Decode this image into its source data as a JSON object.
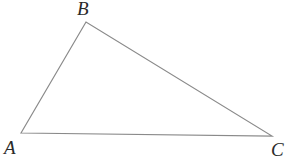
{
  "figure": {
    "kind": "geometry-diagram",
    "shape": "triangle",
    "width": 302,
    "height": 161,
    "background_color": "#ffffff",
    "stroke_color": "#8a8a8a",
    "stroke_width": 1.2,
    "label_color": "#2b2b2b"
  },
  "labels": {
    "a": "A",
    "b": "B",
    "c": "C"
  },
  "vertices": {
    "a": {
      "x": 21,
      "y": 133
    },
    "b": {
      "x": 86,
      "y": 22
    },
    "c": {
      "x": 272,
      "y": 136
    }
  },
  "geometry": {
    "points": "21,133 86,22 272,136",
    "edges": [
      {
        "name": "AB",
        "from": "A",
        "to": "B"
      },
      {
        "name": "BC",
        "from": "B",
        "to": "C"
      },
      {
        "name": "CA",
        "from": "C",
        "to": "A"
      }
    ]
  }
}
